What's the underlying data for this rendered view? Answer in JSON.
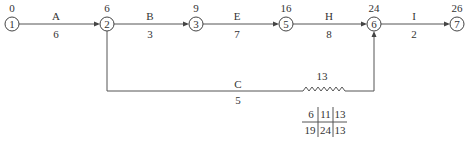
{
  "diagram": {
    "type": "time-scaled network (double-code activity-on-arrow)",
    "nodes": [
      {
        "id": "1",
        "label": "1",
        "time": "0"
      },
      {
        "id": "2",
        "label": "2",
        "time": "6"
      },
      {
        "id": "3",
        "label": "3",
        "time": "9"
      },
      {
        "id": "5",
        "label": "5",
        "time": "16"
      },
      {
        "id": "6",
        "label": "6",
        "time": "24"
      },
      {
        "id": "7",
        "label": "7",
        "time": "26"
      }
    ],
    "activities": [
      {
        "name": "A",
        "duration": "6",
        "from": "1",
        "to": "2"
      },
      {
        "name": "B",
        "duration": "3",
        "from": "2",
        "to": "3"
      },
      {
        "name": "E",
        "duration": "7",
        "from": "3",
        "to": "5"
      },
      {
        "name": "H",
        "duration": "8",
        "from": "5",
        "to": "6"
      },
      {
        "name": "I",
        "duration": "2",
        "from": "6",
        "to": "7"
      },
      {
        "name": "C",
        "duration": "5",
        "from": "2",
        "to": "6",
        "free_float_label": "13"
      }
    ],
    "time_table": {
      "row1": [
        "6",
        "11",
        "13"
      ],
      "row2": [
        "19",
        "24",
        "13"
      ]
    }
  }
}
